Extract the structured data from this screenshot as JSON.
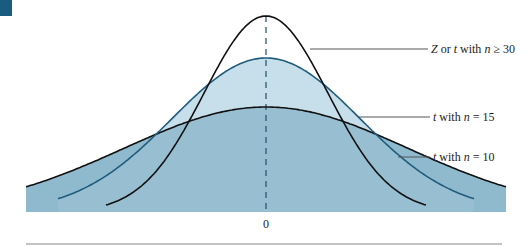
{
  "chart_data": {
    "type": "line",
    "title": "",
    "xlabel": "",
    "ylabel": "",
    "x_ticks": [
      "0"
    ],
    "grid": false,
    "center_line": "dashed vertical line at 0",
    "series": [
      {
        "name": "Z or t with n ≥ 30",
        "label_parts": [
          "Z",
          " or ",
          "t",
          " with ",
          "n",
          " ≥ 30"
        ],
        "peak_px": 196,
        "sigma_px": 62,
        "x_start": 106,
        "x_end": 426,
        "color": "#111111",
        "fill": "none"
      },
      {
        "name": "t with n = 15",
        "label_parts": [
          "t",
          " with ",
          "n",
          " = 15"
        ],
        "peak_px": 154,
        "sigma_px": 94,
        "x_start": 58,
        "x_end": 474,
        "color": "#1f5c7d",
        "fill": "#c6dfea"
      },
      {
        "name": "t with n = 10",
        "label_parts": [
          "t",
          " with ",
          "n",
          " = 10"
        ],
        "peak_px": 105,
        "sigma_px": 142,
        "x_start": 26,
        "x_end": 506,
        "color": "#111111",
        "fill": "#8fb8cc"
      }
    ]
  },
  "colors": {
    "corner": "#1a5c80",
    "background": "#ffffff",
    "outer_fill": "#8fb8cc",
    "mid_fill": "#c6dfea"
  },
  "axis": {
    "zero_label": "0"
  },
  "labels": {
    "z": {
      "text": "Z or t with n ≥ 30"
    },
    "t15": {
      "text": "t with n = 15"
    },
    "t10": {
      "text": "t with n = 10"
    }
  }
}
